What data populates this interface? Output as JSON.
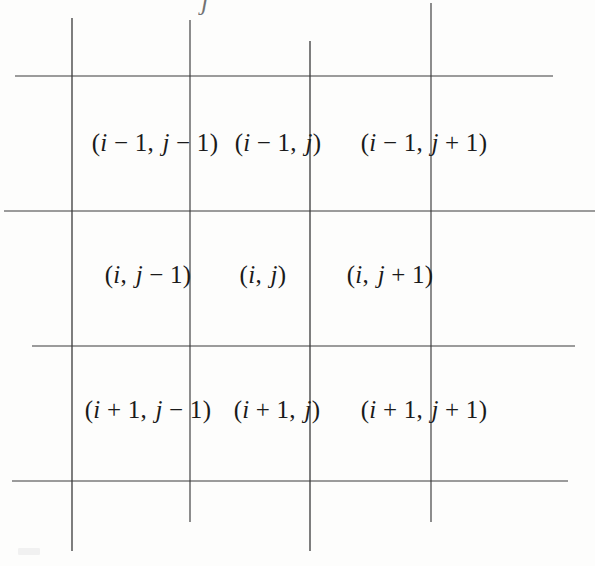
{
  "figure": {
    "name": "finite-difference-stencil-grid",
    "background_color": "#fdfdfc",
    "line_color": "#3a3a3a",
    "text_color": "#1a1a1a"
  },
  "grid": {
    "rows": 3,
    "columns": 3,
    "vertical_lines": [
      {
        "name": "vline-1",
        "x": 72,
        "y_top": 18,
        "y_bottom": 551
      },
      {
        "name": "vline-2",
        "x": 190,
        "y_top": 20,
        "y_bottom": 522
      },
      {
        "name": "vline-3",
        "x": 310,
        "y_top": 41,
        "y_bottom": 551
      },
      {
        "name": "vline-4",
        "x": 431,
        "y_top": 3,
        "y_bottom": 522
      }
    ],
    "horizontal_lines": [
      {
        "name": "hline-1",
        "y": 76,
        "x_start": 15,
        "x_end": 553
      },
      {
        "name": "hline-2",
        "y": 211,
        "x_start": 4,
        "x_end": 595
      },
      {
        "name": "hline-3",
        "y": 346,
        "x_start": 32,
        "x_end": 575
      },
      {
        "name": "hline-4",
        "y": 481,
        "x_start": 12,
        "x_end": 568
      }
    ]
  },
  "cells": [
    {
      "id": "cell-im1-jm1",
      "row": 0,
      "col": 0,
      "cx": 155,
      "cy": 142,
      "text": "(i − 1, j − 1)",
      "i_offset": "-1",
      "j_offset": "-1",
      "parts": {
        "open": "(",
        "i": "i",
        "i_op": "−",
        "i_num": "1",
        "comma": ",",
        "j": "j",
        "j_op": "−",
        "j_num": "1",
        "close": ")"
      }
    },
    {
      "id": "cell-im1-j",
      "row": 0,
      "col": 1,
      "cx": 278,
      "cy": 142,
      "text": "(i − 1, j)",
      "i_offset": "-1",
      "j_offset": "0",
      "parts": {
        "open": "(",
        "i": "i",
        "i_op": "−",
        "i_num": "1",
        "comma": ",",
        "j": "j",
        "j_op": "",
        "j_num": "",
        "close": ")"
      }
    },
    {
      "id": "cell-im1-jp1",
      "row": 0,
      "col": 2,
      "cx": 424,
      "cy": 142,
      "text": "(i − 1, j + 1)",
      "i_offset": "-1",
      "j_offset": "+1",
      "parts": {
        "open": "(",
        "i": "i",
        "i_op": "−",
        "i_num": "1",
        "comma": ",",
        "j": "j",
        "j_op": "+",
        "j_num": "1",
        "close": ")"
      }
    },
    {
      "id": "cell-i-jm1",
      "row": 1,
      "col": 0,
      "cx": 148,
      "cy": 274,
      "text": "(i, j − 1)",
      "i_offset": "0",
      "j_offset": "-1",
      "parts": {
        "open": "(",
        "i": "i",
        "i_op": "",
        "i_num": "",
        "comma": ",",
        "j": "j",
        "j_op": "−",
        "j_num": "1",
        "close": ")"
      }
    },
    {
      "id": "cell-i-j",
      "row": 1,
      "col": 1,
      "cx": 263,
      "cy": 274,
      "text": "(i, j)",
      "i_offset": "0",
      "j_offset": "0",
      "parts": {
        "open": "(",
        "i": "i",
        "i_op": "",
        "i_num": "",
        "comma": ",",
        "j": "j",
        "j_op": "",
        "j_num": "",
        "close": ")"
      }
    },
    {
      "id": "cell-i-jp1",
      "row": 1,
      "col": 2,
      "cx": 390,
      "cy": 274,
      "text": "(i, j + 1)",
      "i_offset": "0",
      "j_offset": "+1",
      "parts": {
        "open": "(",
        "i": "i",
        "i_op": "",
        "i_num": "",
        "comma": ",",
        "j": "j",
        "j_op": "+",
        "j_num": "1",
        "close": ")"
      }
    },
    {
      "id": "cell-ip1-jm1",
      "row": 2,
      "col": 0,
      "cx": 148,
      "cy": 409,
      "text": "(i + 1, j − 1)",
      "i_offset": "+1",
      "j_offset": "-1",
      "parts": {
        "open": "(",
        "i": "i",
        "i_op": "+",
        "i_num": "1",
        "comma": ",",
        "j": "j",
        "j_op": "−",
        "j_num": "1",
        "close": ")"
      }
    },
    {
      "id": "cell-ip1-j",
      "row": 2,
      "col": 1,
      "cx": 277,
      "cy": 409,
      "text": "(i + 1, j)",
      "i_offset": "+1",
      "j_offset": "0",
      "parts": {
        "open": "(",
        "i": "i",
        "i_op": "+",
        "i_num": "1",
        "comma": ",",
        "j": "j",
        "j_op": "",
        "j_num": "",
        "close": ")"
      }
    },
    {
      "id": "cell-ip1-jp1",
      "row": 2,
      "col": 2,
      "cx": 424,
      "cy": 409,
      "text": "(i + 1, j + 1)",
      "i_offset": "+1",
      "j_offset": "+1",
      "parts": {
        "open": "(",
        "i": "i",
        "i_op": "+",
        "i_num": "1",
        "comma": ",",
        "j": "j",
        "j_op": "+",
        "j_num": "1",
        "close": ")"
      }
    }
  ],
  "artifacts": {
    "top_fragment": "j"
  }
}
